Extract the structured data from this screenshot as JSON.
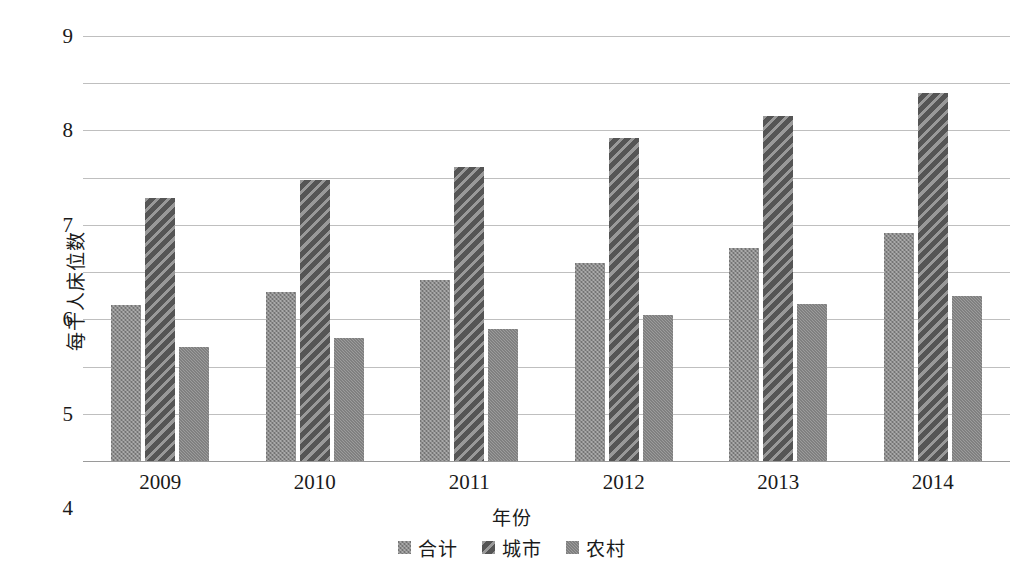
{
  "chart_data": {
    "type": "bar",
    "title": "",
    "xlabel": "年份",
    "ylabel": "每千人床位数",
    "categories": [
      "2009",
      "2010",
      "2011",
      "2012",
      "2013",
      "2014"
    ],
    "series": [
      {
        "name": "合计",
        "values": [
          3.31,
          3.58,
          3.84,
          4.2,
          4.52,
          4.83
        ],
        "color": "#8d8d8d",
        "pattern": "checker-light"
      },
      {
        "name": "城市",
        "values": [
          5.56,
          5.96,
          6.23,
          6.84,
          7.31,
          7.79
        ],
        "color": "#6d6d6d",
        "pattern": "diagonal-stripe"
      },
      {
        "name": "农村",
        "values": [
          2.41,
          2.6,
          2.8,
          3.1,
          3.33,
          3.49
        ],
        "color": "#8a8a8a",
        "pattern": "checker-medium"
      }
    ],
    "ylim": [
      0,
      9
    ],
    "ytick_step": 1,
    "yticks": [
      "9",
      "8",
      "7",
      "6",
      "5",
      "4",
      "3",
      "2",
      "1",
      "0"
    ],
    "grid": true,
    "grid_color": "#bfbfbf",
    "legend_position": "bottom"
  },
  "legend": {
    "items": [
      {
        "label": "合计"
      },
      {
        "label": "城市"
      },
      {
        "label": "农村"
      }
    ]
  }
}
